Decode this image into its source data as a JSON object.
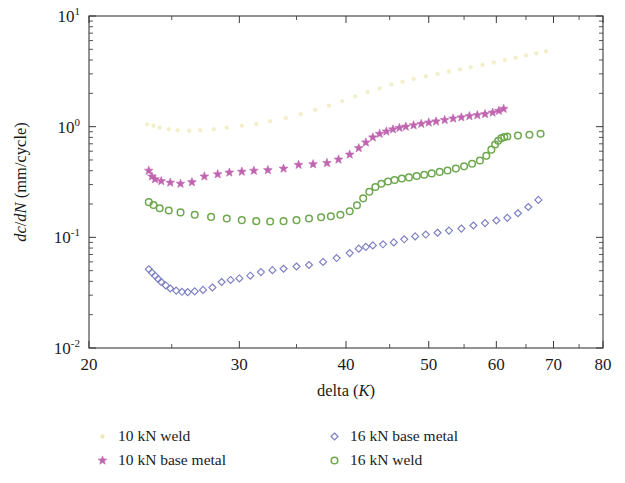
{
  "chart_data": {
    "type": "scatter",
    "title": "",
    "xlabel": "delta (K)",
    "ylabel": "dc/dN (mm/cycle)",
    "xscale": "log",
    "yscale": "log",
    "xlim": [
      20,
      80
    ],
    "ylim": [
      0.01,
      10
    ],
    "xticks": [
      20,
      30,
      40,
      50,
      60,
      70,
      80
    ],
    "xticklabels": [
      "20",
      "30",
      "40",
      "50",
      "60",
      "70",
      "80"
    ],
    "yticks": [
      0.01,
      0.1,
      1,
      10
    ],
    "yticklabels": [
      "10^-2",
      "10^-1",
      "10^0",
      "10^1"
    ],
    "grid": false,
    "legend_position": "below-plot",
    "series": [
      {
        "name": "10 kN weld",
        "marker": "point",
        "color": "#f2eec8",
        "points": [
          [
            23.4,
            1.05
          ],
          [
            23.8,
            1.02
          ],
          [
            24.2,
            0.98
          ],
          [
            24.8,
            0.95
          ],
          [
            25.4,
            0.93
          ],
          [
            26.2,
            0.92
          ],
          [
            27.0,
            0.93
          ],
          [
            28.0,
            0.95
          ],
          [
            29.0,
            0.98
          ],
          [
            30.2,
            1.02
          ],
          [
            31.4,
            1.06
          ],
          [
            32.6,
            1.12
          ],
          [
            34.0,
            1.2
          ],
          [
            35.4,
            1.3
          ],
          [
            36.8,
            1.42
          ],
          [
            38.2,
            1.55
          ],
          [
            39.6,
            1.7
          ],
          [
            41.0,
            1.88
          ],
          [
            42.4,
            2.05
          ],
          [
            43.8,
            2.22
          ],
          [
            45.2,
            2.4
          ],
          [
            46.6,
            2.55
          ],
          [
            48.0,
            2.7
          ],
          [
            49.6,
            2.85
          ],
          [
            51.2,
            3.0
          ],
          [
            52.8,
            3.15
          ],
          [
            54.4,
            3.3
          ],
          [
            56.0,
            3.45
          ],
          [
            57.8,
            3.62
          ],
          [
            59.6,
            3.8
          ],
          [
            61.4,
            4.0
          ],
          [
            63.2,
            4.2
          ],
          [
            65.0,
            4.4
          ],
          [
            66.8,
            4.6
          ],
          [
            68.6,
            4.8
          ]
        ]
      },
      {
        "name": "10 kN base metal",
        "marker": "star",
        "color": "#c064b0",
        "points": [
          [
            23.5,
            0.4
          ],
          [
            23.7,
            0.355
          ],
          [
            23.9,
            0.335
          ],
          [
            24.3,
            0.322
          ],
          [
            24.9,
            0.312
          ],
          [
            25.6,
            0.305
          ],
          [
            26.4,
            0.315
          ],
          [
            27.3,
            0.355
          ],
          [
            28.3,
            0.372
          ],
          [
            29.2,
            0.385
          ],
          [
            30.2,
            0.392
          ],
          [
            31.2,
            0.4
          ],
          [
            32.4,
            0.405
          ],
          [
            33.8,
            0.418
          ],
          [
            35.2,
            0.452
          ],
          [
            36.6,
            0.458
          ],
          [
            38.0,
            0.47
          ],
          [
            39.2,
            0.505
          ],
          [
            40.4,
            0.56
          ],
          [
            41.4,
            0.64
          ],
          [
            42.2,
            0.72
          ],
          [
            43.0,
            0.8
          ],
          [
            43.8,
            0.862
          ],
          [
            44.6,
            0.905
          ],
          [
            45.4,
            0.945
          ],
          [
            46.2,
            0.975
          ],
          [
            47.0,
            1.0
          ],
          [
            48.0,
            1.03
          ],
          [
            49.0,
            1.06
          ],
          [
            50.0,
            1.09
          ],
          [
            51.0,
            1.115
          ],
          [
            52.2,
            1.15
          ],
          [
            53.4,
            1.185
          ],
          [
            54.6,
            1.215
          ],
          [
            55.8,
            1.245
          ],
          [
            57.0,
            1.27
          ],
          [
            58.2,
            1.3
          ],
          [
            59.4,
            1.34
          ],
          [
            60.4,
            1.39
          ],
          [
            61.2,
            1.45
          ]
        ]
      },
      {
        "name": "16 kN base metal",
        "marker": "diamond",
        "color": "#7c7fc4",
        "points": [
          [
            23.5,
            0.0515
          ],
          [
            23.7,
            0.048
          ],
          [
            23.9,
            0.045
          ],
          [
            24.1,
            0.042
          ],
          [
            24.3,
            0.0395
          ],
          [
            24.6,
            0.0368
          ],
          [
            24.9,
            0.0345
          ],
          [
            25.3,
            0.033
          ],
          [
            25.7,
            0.0322
          ],
          [
            26.1,
            0.032
          ],
          [
            26.6,
            0.0325
          ],
          [
            27.2,
            0.0335
          ],
          [
            27.9,
            0.0352
          ],
          [
            28.6,
            0.0395
          ],
          [
            29.3,
            0.0412
          ],
          [
            30.0,
            0.0425
          ],
          [
            30.9,
            0.045
          ],
          [
            31.8,
            0.0485
          ],
          [
            32.8,
            0.0505
          ],
          [
            33.8,
            0.052
          ],
          [
            35.0,
            0.0545
          ],
          [
            36.2,
            0.0562
          ],
          [
            37.6,
            0.06
          ],
          [
            39.0,
            0.065
          ],
          [
            40.4,
            0.072
          ],
          [
            41.4,
            0.079
          ],
          [
            42.2,
            0.082
          ],
          [
            43.0,
            0.0845
          ],
          [
            44.2,
            0.0865
          ],
          [
            45.5,
            0.09
          ],
          [
            46.8,
            0.096
          ],
          [
            48.2,
            0.102
          ],
          [
            49.6,
            0.106
          ],
          [
            51.2,
            0.11
          ],
          [
            52.8,
            0.115
          ],
          [
            54.6,
            0.12
          ],
          [
            56.4,
            0.128
          ],
          [
            58.2,
            0.1345
          ],
          [
            60.0,
            0.142
          ],
          [
            61.8,
            0.15
          ],
          [
            63.6,
            0.165
          ],
          [
            65.4,
            0.188
          ],
          [
            67.2,
            0.218
          ]
        ]
      },
      {
        "name": "16 kN weld",
        "marker": "circle",
        "color": "#6fa84f",
        "points": [
          [
            23.5,
            0.208
          ],
          [
            23.8,
            0.196
          ],
          [
            24.2,
            0.183
          ],
          [
            24.8,
            0.175
          ],
          [
            25.6,
            0.168
          ],
          [
            26.6,
            0.16
          ],
          [
            27.8,
            0.153
          ],
          [
            29.0,
            0.148
          ],
          [
            30.2,
            0.143
          ],
          [
            31.4,
            0.14
          ],
          [
            32.6,
            0.139
          ],
          [
            33.8,
            0.14
          ],
          [
            35.0,
            0.143
          ],
          [
            36.2,
            0.148
          ],
          [
            37.4,
            0.152
          ],
          [
            38.4,
            0.155
          ],
          [
            39.4,
            0.16
          ],
          [
            40.4,
            0.172
          ],
          [
            41.2,
            0.195
          ],
          [
            41.9,
            0.225
          ],
          [
            42.6,
            0.258
          ],
          [
            43.3,
            0.285
          ],
          [
            44.0,
            0.305
          ],
          [
            44.8,
            0.32
          ],
          [
            45.6,
            0.33
          ],
          [
            46.5,
            0.34
          ],
          [
            47.4,
            0.348
          ],
          [
            48.4,
            0.358
          ],
          [
            49.4,
            0.368
          ],
          [
            50.4,
            0.378
          ],
          [
            51.5,
            0.39
          ],
          [
            52.6,
            0.402
          ],
          [
            53.8,
            0.418
          ],
          [
            55.0,
            0.438
          ],
          [
            56.2,
            0.462
          ],
          [
            57.4,
            0.495
          ],
          [
            58.4,
            0.545
          ],
          [
            59.2,
            0.62
          ],
          [
            59.8,
            0.69
          ],
          [
            60.3,
            0.745
          ],
          [
            60.8,
            0.785
          ],
          [
            61.3,
            0.805
          ],
          [
            61.8,
            0.815
          ],
          [
            63.6,
            0.83
          ],
          [
            65.6,
            0.845
          ],
          [
            67.6,
            0.862
          ]
        ]
      }
    ]
  },
  "legend": {
    "entries": [
      {
        "label": "10 kN weld",
        "marker": "point",
        "color": "#efe9b6"
      },
      {
        "label": "16 kN base metal",
        "marker": "diamond",
        "color": "#7c7fc4"
      },
      {
        "label": "10 kN base metal",
        "marker": "star",
        "color": "#c064b0"
      },
      {
        "label": "16 kN weld",
        "marker": "circle",
        "color": "#6fa84f"
      }
    ]
  }
}
